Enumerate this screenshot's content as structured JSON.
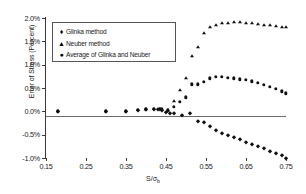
{
  "chart_data": {
    "type": "scatter",
    "title": "",
    "xlabel": "S/σb",
    "xlabel_main": "S/σ",
    "xlabel_sub": "b",
    "ylabel": "Error of Stress (Percent)",
    "xlim": [
      0.15,
      0.75
    ],
    "ylim": [
      -0.01,
      0.02
    ],
    "xticks": [
      "0.15",
      "0.25",
      "0.35",
      "0.45",
      "0.55",
      "0.65",
      "0.75"
    ],
    "xtick_values": [
      0.15,
      0.25,
      0.35,
      0.45,
      0.55,
      0.65,
      0.75
    ],
    "yticks": [
      "-1.0%",
      "-0.5%",
      "0.0%",
      "0.5%",
      "1.0%",
      "1.5%",
      "2.0%"
    ],
    "ytick_values": [
      -0.01,
      -0.005,
      0.0,
      0.005,
      0.01,
      0.015,
      0.02
    ],
    "grid": false,
    "legend_position": "upper-left-inside",
    "marker_color": "#101010",
    "axis_color": "#3a3a3a",
    "series": [
      {
        "name": "Glinka method",
        "marker": "diamond",
        "x": [
          0.18,
          0.3,
          0.35,
          0.38,
          0.4,
          0.42,
          0.43,
          0.435,
          0.44,
          0.45,
          0.46,
          0.47,
          0.49,
          0.51,
          0.53,
          0.545,
          0.56,
          0.575,
          0.59,
          0.605,
          0.62,
          0.635,
          0.65,
          0.665,
          0.68,
          0.695,
          0.71,
          0.725,
          0.74,
          0.75
        ],
        "y": [
          0.0,
          0.0,
          0.0,
          0.0003,
          0.0004,
          0.0005,
          0.0005,
          0.0004,
          0.0003,
          -0.0002,
          -0.0004,
          -0.0003,
          -0.0008,
          -0.0003,
          -0.0021,
          -0.0023,
          -0.0031,
          -0.004,
          -0.0046,
          -0.0051,
          -0.0056,
          -0.006,
          -0.0065,
          -0.007,
          -0.0074,
          -0.0079,
          -0.0084,
          -0.0089,
          -0.0094,
          -0.01
        ]
      },
      {
        "name": "Neuber method",
        "marker": "triangle",
        "x": [
          0.455,
          0.47,
          0.485,
          0.5,
          0.515,
          0.53,
          0.545,
          0.56,
          0.575,
          0.59,
          0.605,
          0.62,
          0.635,
          0.65,
          0.665,
          0.68,
          0.695,
          0.71,
          0.725,
          0.74,
          0.75
        ],
        "y": [
          0.0002,
          0.0022,
          0.0045,
          0.0072,
          0.0118,
          0.0137,
          0.0167,
          0.018,
          0.0186,
          0.0189,
          0.019,
          0.0191,
          0.0191,
          0.019,
          0.0189,
          0.0187,
          0.0185,
          0.0184,
          0.0183,
          0.0181,
          0.018
        ]
      },
      {
        "name": "Average of Glinka and Neuber",
        "marker": "circle",
        "x": [
          0.18,
          0.3,
          0.35,
          0.38,
          0.4,
          0.42,
          0.435,
          0.44,
          0.455,
          0.47,
          0.485,
          0.5,
          0.515,
          0.53,
          0.545,
          0.56,
          0.575,
          0.59,
          0.605,
          0.62,
          0.635,
          0.65,
          0.665,
          0.68,
          0.695,
          0.71,
          0.725,
          0.74,
          0.75
        ],
        "y": [
          0.0,
          0.0,
          0.0,
          0.0003,
          0.0004,
          0.0005,
          0.0005,
          0.0004,
          0.0002,
          0.001,
          0.002,
          0.003,
          0.0058,
          0.0058,
          0.0063,
          0.0071,
          0.0074,
          0.0074,
          0.0072,
          0.0071,
          0.0069,
          0.0067,
          0.0064,
          0.0061,
          0.0057,
          0.0052,
          0.0048,
          0.0043,
          0.0039
        ]
      }
    ],
    "legend": [
      {
        "label": "Glinka method",
        "marker_glyph": "♦"
      },
      {
        "label": "Neuber method",
        "marker_glyph": "▲"
      },
      {
        "label": "Average of Glinka and Neuber",
        "marker_glyph": "●"
      }
    ]
  }
}
